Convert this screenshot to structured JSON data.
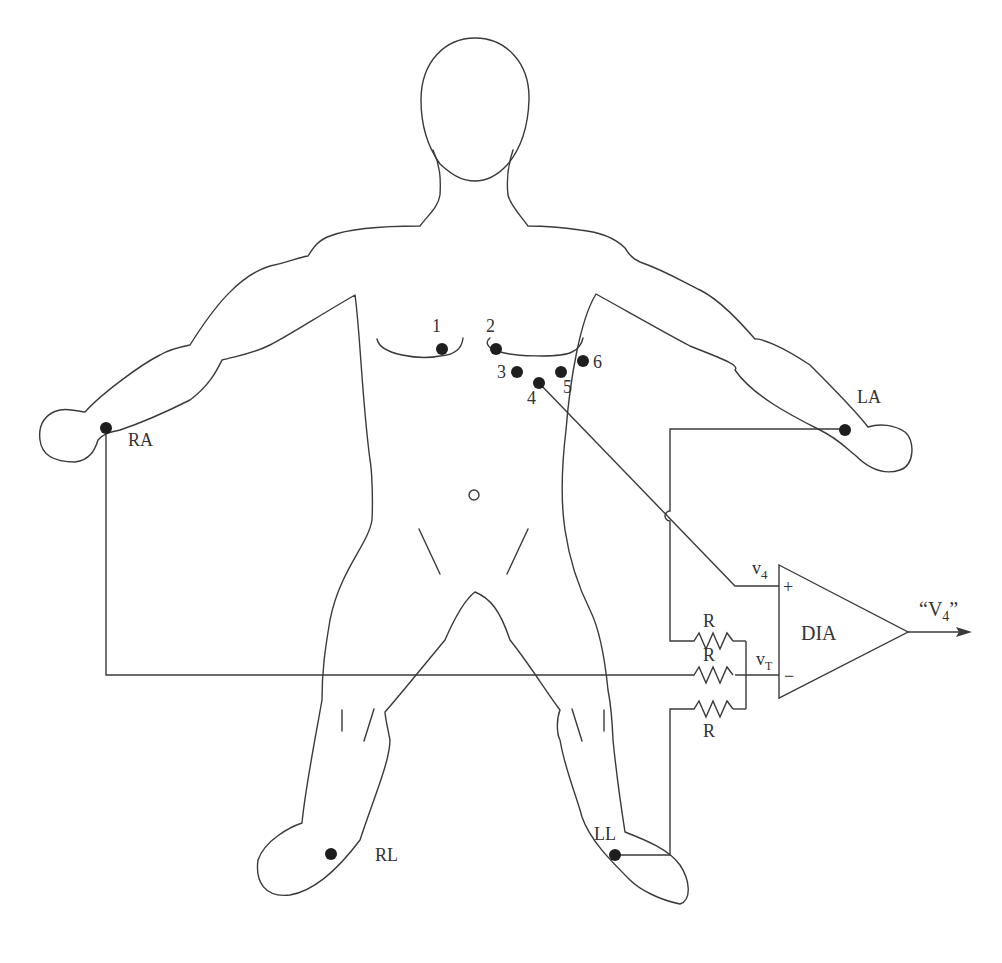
{
  "figure": {
    "body_outline": "human-figure-front-view",
    "limb_electrodes": [
      {
        "id": "RA",
        "label": "RA"
      },
      {
        "id": "LA",
        "label": "LA"
      },
      {
        "id": "RL",
        "label": "RL"
      },
      {
        "id": "LL",
        "label": "LL"
      }
    ],
    "chest_electrodes": [
      {
        "id": "1",
        "label": "1"
      },
      {
        "id": "2",
        "label": "2"
      },
      {
        "id": "3",
        "label": "3"
      },
      {
        "id": "4",
        "label": "4"
      },
      {
        "id": "5",
        "label": "5"
      },
      {
        "id": "6",
        "label": "6"
      }
    ],
    "circuit": {
      "resistors": [
        {
          "label": "R"
        },
        {
          "label": "R"
        },
        {
          "label": "R"
        }
      ],
      "amplifier": {
        "label": "DIA",
        "plus_input": "+",
        "minus_input": "−",
        "plus_signal": "v",
        "plus_signal_sub": "4",
        "minus_signal": "v",
        "minus_signal_sub": "T"
      },
      "output": {
        "open_quote": "“V",
        "sub": "4",
        "close_quote": "”"
      }
    }
  }
}
